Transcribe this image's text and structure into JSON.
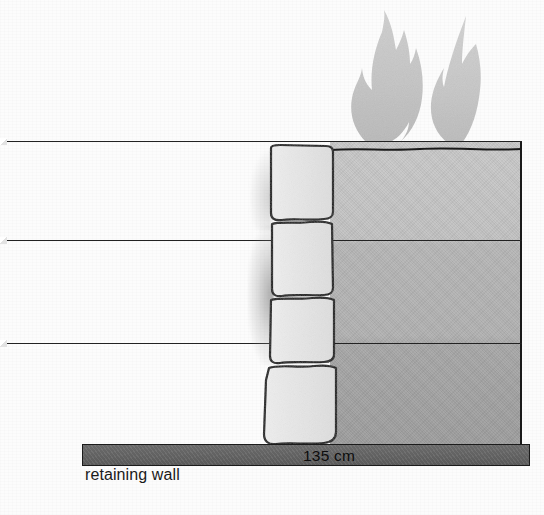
{
  "figure": {
    "background_color": "#fcfcfc"
  },
  "labels": {
    "dimension": "135 cm",
    "wall_caption": "retaining wall"
  },
  "colors": {
    "soil_gray": "#bdbdbd",
    "wall_gray": "#676767",
    "flame_gray": "#c3c3c3",
    "stone_fill": "#e8e8e8",
    "outline": "#1a1a1a",
    "background": "#fcfcfc"
  },
  "elements": {
    "flames": [
      {
        "name": "flame-left",
        "x": 350,
        "y": 18,
        "width": 70,
        "height": 122
      },
      {
        "name": "flame-right",
        "x": 432,
        "y": 22,
        "width": 58,
        "height": 118
      }
    ],
    "strata_lines": [
      {
        "name": "strata-line-1",
        "y": 141
      },
      {
        "name": "strata-line-2",
        "y": 240
      },
      {
        "name": "strata-line-3",
        "y": 343
      }
    ],
    "stone_blocks": [
      {
        "name": "stone-block-1",
        "order": 1,
        "top": 147,
        "bottom": 219
      },
      {
        "name": "stone-block-2",
        "order": 2,
        "top": 222,
        "bottom": 294
      },
      {
        "name": "stone-block-3",
        "order": 3,
        "top": 297,
        "bottom": 361
      },
      {
        "name": "stone-block-4",
        "order": 4,
        "top": 365,
        "bottom": 445
      }
    ],
    "soil_mass": {
      "x": 330,
      "y": 141,
      "width": 192,
      "height": 304
    },
    "retaining_wall": {
      "x": 82,
      "y": 444,
      "width": 448,
      "height": 22
    }
  }
}
